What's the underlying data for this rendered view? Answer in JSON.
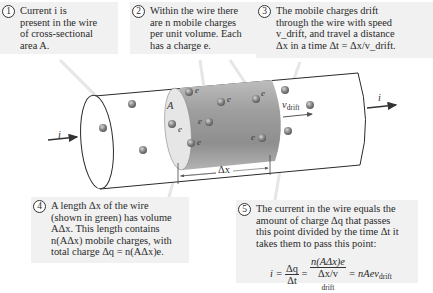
{
  "callouts": [
    {
      "number": "1",
      "lines": [
        "Current i is",
        "present in the wire",
        "of cross-sectional",
        "area A."
      ]
    },
    {
      "number": "2",
      "lines": [
        "Within the wire there",
        "are n mobile charges",
        "per unit volume. Each",
        "has a charge e."
      ]
    },
    {
      "number": "3",
      "lines": [
        "The mobile charges drift",
        "through the wire with speed",
        "v_drift, and travel a distance",
        "Δx in a time Δt = Δx/v_drift."
      ]
    },
    {
      "number": "4",
      "lines": [
        "A length Δx of the wire",
        "(shown in green) has volume",
        "AΔx. This length contains",
        "n(AΔx) mobile charges, with",
        "total charge Δq = n(AΔx)e."
      ]
    },
    {
      "number": "5",
      "lines": [
        "The current in the wire equals the",
        "amount of charge Δq that passes",
        "this point divided by the time Δt it",
        "takes them to pass this point:"
      ]
    }
  ],
  "equation": {
    "lhs": "i =",
    "frac1_num": "Δq",
    "frac1_den": "Δt",
    "eq2": "=",
    "frac2_num": "n(AΔx)e",
    "frac2_den": "Δx/v",
    "frac2_den_sub": "drift",
    "rhs": "= nAev",
    "rhs_sub": "drift"
  },
  "diagram_labels": {
    "current_left": "i",
    "current_right": "i",
    "area": "A",
    "charge": "e",
    "drift_velocity": "v",
    "drift_sub": "drift",
    "delta_x": "Δx"
  },
  "colors": {
    "callout_bg": "#f1f1f1",
    "segment_dark": "#9a9a9a",
    "segment_light": "#d6d6d6",
    "outline": "#2a2a2a"
  }
}
